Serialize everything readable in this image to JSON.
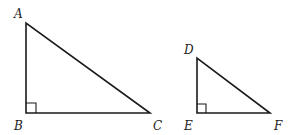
{
  "diagram": {
    "colors": {
      "stroke": "#1a1a1a",
      "label": "#222222",
      "background": "#ffffff"
    },
    "triangles": [
      {
        "name": "ABC",
        "right_angle_at": "B",
        "vertices": [
          {
            "label": "A",
            "x": 26,
            "y": 23
          },
          {
            "label": "B",
            "x": 26,
            "y": 113
          },
          {
            "label": "C",
            "x": 150,
            "y": 113
          }
        ]
      },
      {
        "name": "DEF",
        "right_angle_at": "E",
        "vertices": [
          {
            "label": "D",
            "x": 197,
            "y": 58
          },
          {
            "label": "E",
            "x": 197,
            "y": 113
          },
          {
            "label": "F",
            "x": 270,
            "y": 113
          }
        ]
      }
    ]
  }
}
